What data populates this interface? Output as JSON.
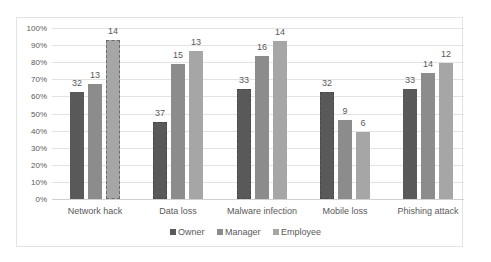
{
  "chart_data": {
    "type": "bar",
    "title": "",
    "xlabel": "",
    "ylabel": "",
    "ylim": [
      0,
      100
    ],
    "yticks": [
      "0%",
      "10%",
      "20%",
      "30%",
      "40%",
      "50%",
      "60%",
      "70%",
      "80%",
      "90%",
      "100%"
    ],
    "grid": true,
    "legend_position": "bottom",
    "categories": [
      "Network hack",
      "Data loss",
      "Malware infection",
      "Mobile loss",
      "Phishing attack"
    ],
    "series": [
      {
        "name": "Owner",
        "color": "#595959",
        "values": [
          62.5,
          45,
          64.5,
          62.5,
          64.5
        ],
        "data_labels": [
          "32",
          "37",
          "33",
          "32",
          "33"
        ],
        "dashed_outline": [
          false,
          true,
          true,
          true,
          false
        ]
      },
      {
        "name": "Manager",
        "color": "#8c8c8c",
        "values": [
          67.5,
          79,
          83.5,
          46,
          73.5
        ],
        "data_labels": [
          "13",
          "15",
          "16",
          "9",
          "14"
        ],
        "dashed_outline": [
          false,
          false,
          false,
          false,
          false
        ]
      },
      {
        "name": "Employee",
        "color": "#a6a6a6",
        "values": [
          93,
          86.5,
          92.5,
          39,
          79.5
        ],
        "data_labels": [
          "14",
          "13",
          "14",
          "6",
          "12"
        ],
        "dashed_outline": [
          true,
          false,
          false,
          false,
          false
        ]
      }
    ]
  },
  "legend": {
    "items": [
      {
        "label": "Owner",
        "color": "#595959"
      },
      {
        "label": "Manager",
        "color": "#8c8c8c"
      },
      {
        "label": "Employee",
        "color": "#a6a6a6"
      }
    ]
  }
}
